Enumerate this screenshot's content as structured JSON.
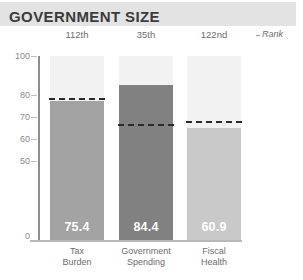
{
  "header": {
    "title": "GOVERNMENT SIZE",
    "rank_legend": "Rank",
    "rank_legend_marker": "dash-marker-icon"
  },
  "chart_data": {
    "type": "bar",
    "title": "GOVERNMENT SIZE",
    "xlabel": "",
    "ylabel": "",
    "ylim": [
      0,
      100
    ],
    "grid": false,
    "legend": "Rank",
    "yticks": [
      {
        "label": "100",
        "value": 100
      },
      {
        "label": "80",
        "value": 80
      },
      {
        "label": "70",
        "value": 70
      },
      {
        "label": "60",
        "value": 60
      },
      {
        "label": "50",
        "value": 50
      },
      {
        "label": "0",
        "value": 0
      }
    ],
    "categories": [
      "Tax Burden",
      "Government Spending",
      "Fiscal Health"
    ],
    "values": [
      75.4,
      84.4,
      60.9
    ],
    "value_labels": [
      "75.4",
      "84.4",
      "60.9"
    ],
    "ranks": [
      "112th",
      "35th",
      "122nd"
    ],
    "reference_lines": [
      77.3,
      63.0,
      64.5
    ],
    "bar_colors": [
      "#a3a3a3",
      "#818181",
      "#c9c9c9"
    ],
    "track_color": "#f2f2f2",
    "reference_line_color": "#2b2b2b",
    "bars": [
      {
        "category": "Tax Burden",
        "category_line1": "Tax",
        "category_line2": "Burden",
        "value": 75.4,
        "value_label": "75.4",
        "rank": "112th",
        "reference_line": 77.3,
        "color": "#a3a3a3"
      },
      {
        "category": "Government Spending",
        "category_line1": "Government",
        "category_line2": "Spending",
        "value": 84.4,
        "value_label": "84.4",
        "rank": "35th",
        "reference_line": 63.0,
        "color": "#818181"
      },
      {
        "category": "Fiscal Health",
        "category_line1": "Fiscal",
        "category_line2": "Health",
        "value": 60.9,
        "value_label": "60.9",
        "rank": "122nd",
        "reference_line": 64.5,
        "color": "#c9c9c9"
      }
    ]
  },
  "colors": {
    "title_band": "#e3e3e3",
    "title_text": "#3b3b3b",
    "axis": "#8e8e8e",
    "tick_text": "#8a8a8a",
    "caption_text": "#6d6d6d"
  }
}
